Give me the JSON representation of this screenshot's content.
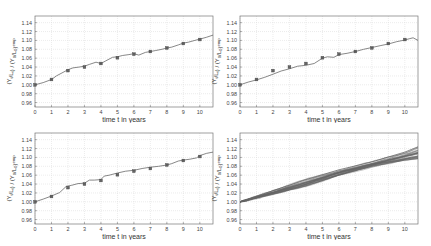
{
  "chart_data": [
    {
      "type": "line",
      "panel": "top-left",
      "title": "",
      "xlabel": "time t in years",
      "ylabel": "(Y_t/L_t) / (Y_0/L_0)^emp",
      "xlim": [
        0,
        10.8
      ],
      "ylim": [
        0.95,
        1.155
      ],
      "xticks": [
        0,
        1,
        2,
        3,
        4,
        5,
        6,
        7,
        8,
        9,
        10
      ],
      "yticks": [
        0.96,
        0.98,
        1.0,
        1.02,
        1.04,
        1.06,
        1.08,
        1.1,
        1.12,
        1.14
      ],
      "ytick_labels": [
        "0.96",
        "0.98",
        "1.00",
        "1.02",
        "1.04",
        "1.06",
        "1.08",
        "1.10",
        "1.12",
        "1.14"
      ],
      "grid": true,
      "series": [
        {
          "name": "empirical",
          "style": "markers",
          "x": [
            0,
            1,
            2,
            3,
            4,
            5,
            6,
            7,
            8,
            9,
            10
          ],
          "y": [
            1.0,
            1.012,
            1.032,
            1.04,
            1.048,
            1.061,
            1.069,
            1.075,
            1.083,
            1.093,
            1.102
          ]
        },
        {
          "name": "simulation",
          "style": "line",
          "x": [
            0,
            0.5,
            1,
            1.3,
            1.7,
            2,
            2.3,
            2.7,
            3,
            3.3,
            3.7,
            4,
            4.3,
            4.7,
            5,
            5.3,
            5.7,
            6,
            6.3,
            6.7,
            7,
            7.3,
            7.7,
            8,
            8.3,
            8.7,
            9,
            9.3,
            9.7,
            10,
            10.4,
            10.8
          ],
          "y": [
            1.0,
            1.005,
            1.012,
            1.02,
            1.028,
            1.034,
            1.038,
            1.04,
            1.042,
            1.046,
            1.051,
            1.048,
            1.054,
            1.062,
            1.063,
            1.066,
            1.068,
            1.07,
            1.067,
            1.073,
            1.075,
            1.077,
            1.08,
            1.083,
            1.085,
            1.09,
            1.094,
            1.096,
            1.1,
            1.103,
            1.107,
            1.112
          ]
        }
      ]
    },
    {
      "type": "line",
      "panel": "top-right",
      "title": "",
      "xlabel": "time t in years",
      "ylabel": "(Y_t/L_t) / (Y_0/L_0)^emp",
      "xlim": [
        0,
        10.8
      ],
      "ylim": [
        0.95,
        1.155
      ],
      "xticks": [
        0,
        1,
        2,
        3,
        4,
        5,
        6,
        7,
        8,
        9,
        10
      ],
      "yticks": [
        0.96,
        0.98,
        1.0,
        1.02,
        1.04,
        1.06,
        1.08,
        1.1,
        1.12,
        1.14
      ],
      "ytick_labels": [
        "0.96",
        "0.98",
        "1.00",
        "1.02",
        "1.04",
        "1.06",
        "1.08",
        "1.10",
        "1.12",
        "1.14"
      ],
      "grid": true,
      "series": [
        {
          "name": "empirical",
          "style": "markers",
          "x": [
            0,
            1,
            2,
            3,
            4,
            5,
            6,
            7,
            8,
            9,
            10
          ],
          "y": [
            1.0,
            1.012,
            1.032,
            1.04,
            1.048,
            1.061,
            1.069,
            1.075,
            1.083,
            1.093,
            1.102
          ]
        },
        {
          "name": "simulation",
          "style": "line",
          "x": [
            0,
            0.5,
            1,
            1.5,
            2,
            2.5,
            3,
            3.5,
            4,
            4.5,
            5,
            5.3,
            5.7,
            6,
            6.5,
            7,
            7.5,
            8,
            8.5,
            9,
            9.5,
            10,
            10.3,
            10.5,
            10.8
          ],
          "y": [
            1.0,
            1.006,
            1.011,
            1.017,
            1.024,
            1.031,
            1.036,
            1.042,
            1.044,
            1.048,
            1.06,
            1.063,
            1.062,
            1.068,
            1.071,
            1.075,
            1.08,
            1.084,
            1.088,
            1.092,
            1.097,
            1.101,
            1.104,
            1.106,
            1.1
          ]
        }
      ]
    },
    {
      "type": "line",
      "panel": "bottom-left",
      "title": "",
      "xlabel": "time t in years",
      "ylabel": "(Y_t/L_t) / (Y_0/L_0)^emp",
      "xlim": [
        0,
        10.8
      ],
      "ylim": [
        0.95,
        1.155
      ],
      "xticks": [
        0,
        1,
        2,
        3,
        4,
        5,
        6,
        7,
        8,
        9,
        10
      ],
      "yticks": [
        0.96,
        0.98,
        1.0,
        1.02,
        1.04,
        1.06,
        1.08,
        1.1,
        1.12,
        1.14
      ],
      "ytick_labels": [
        "0.96",
        "0.98",
        "1.00",
        "1.02",
        "1.04",
        "1.06",
        "1.08",
        "1.10",
        "1.12",
        "1.14"
      ],
      "grid": true,
      "series": [
        {
          "name": "empirical",
          "style": "markers",
          "x": [
            0,
            1,
            2,
            3,
            4,
            5,
            6,
            7,
            8,
            9,
            10
          ],
          "y": [
            1.0,
            1.012,
            1.032,
            1.04,
            1.048,
            1.061,
            1.069,
            1.075,
            1.083,
            1.093,
            1.102
          ]
        },
        {
          "name": "simulation",
          "style": "line",
          "x": [
            0,
            0.5,
            1,
            1.5,
            1.9,
            2.2,
            2.6,
            3,
            3.3,
            3.6,
            4,
            4.2,
            4.5,
            5,
            5.5,
            6,
            6.5,
            7,
            7.5,
            8,
            8.3,
            8.7,
            9,
            9.4,
            9.8,
            10,
            10.4,
            10.8
          ],
          "y": [
            1.0,
            1.006,
            1.013,
            1.021,
            1.035,
            1.037,
            1.041,
            1.042,
            1.049,
            1.049,
            1.05,
            1.058,
            1.06,
            1.065,
            1.069,
            1.071,
            1.075,
            1.078,
            1.08,
            1.083,
            1.086,
            1.092,
            1.094,
            1.096,
            1.099,
            1.104,
            1.109,
            1.112
          ]
        }
      ]
    },
    {
      "type": "line",
      "panel": "bottom-right",
      "title": "",
      "xlabel": "time t in years",
      "ylabel": "(Y_t/L_t) / (Y_0/L_0)^emp",
      "xlim": [
        0,
        10.8
      ],
      "ylim": [
        0.95,
        1.155
      ],
      "xticks": [
        0,
        1,
        2,
        3,
        4,
        5,
        6,
        7,
        8,
        9,
        10
      ],
      "yticks": [
        0.96,
        0.98,
        1.0,
        1.02,
        1.04,
        1.06,
        1.08,
        1.1,
        1.12,
        1.14
      ],
      "ytick_labels": [
        "0.96",
        "0.98",
        "1.00",
        "1.02",
        "1.04",
        "1.06",
        "1.08",
        "1.10",
        "1.12",
        "1.14"
      ],
      "grid": true,
      "description": "ensemble of ~30 simulation runs starting at 1.00 and fanning out to roughly 1.095–1.125 at t=10.8",
      "series": [
        {
          "name": "ensemble_low",
          "style": "line",
          "x": [
            0,
            2,
            4,
            6,
            8,
            10,
            10.8
          ],
          "y": [
            1.0,
            1.018,
            1.036,
            1.06,
            1.08,
            1.094,
            1.097
          ]
        },
        {
          "name": "ensemble_mid",
          "style": "line",
          "x": [
            0,
            2,
            4,
            6,
            8,
            10,
            10.8
          ],
          "y": [
            1.0,
            1.021,
            1.043,
            1.066,
            1.085,
            1.103,
            1.11
          ]
        },
        {
          "name": "ensemble_high",
          "style": "line",
          "x": [
            0,
            2,
            4,
            6,
            8,
            10,
            10.8
          ],
          "y": [
            1.0,
            1.025,
            1.05,
            1.072,
            1.09,
            1.112,
            1.124
          ]
        }
      ]
    }
  ]
}
